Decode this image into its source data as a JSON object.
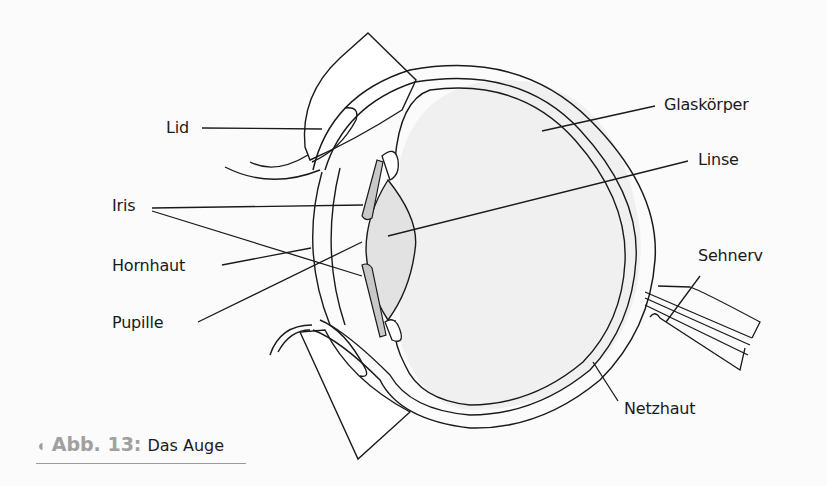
{
  "figure": {
    "caption_number": "Abb. 13:",
    "caption_title": "Das Auge",
    "caption_marker": "◖"
  },
  "labels": {
    "lid": "Lid",
    "iris": "Iris",
    "hornhaut": "Hornhaut",
    "pupille": "Pupille",
    "glaskoerper": "Glaskörper",
    "linse": "Linse",
    "sehnerv": "Sehnerv",
    "netzhaut": "Netzhaut"
  },
  "colors": {
    "line": "#1a1a1a",
    "lens_fill": "#e2e2e2",
    "vitreous_fill": "#f0f0f0",
    "iris_fill": "#c8c8c8",
    "caption_gray": "#a0a0a0"
  }
}
